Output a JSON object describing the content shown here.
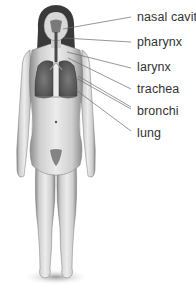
{
  "diagram": {
    "figure": "female human body, front view",
    "colors": {
      "background": "#ffffff",
      "label_text": "#333333",
      "leader_line": "#6a6a6a",
      "skin_light": "#e6e6e6",
      "skin_mid": "#b8b8b8",
      "skin_dark": "#6e6e6e",
      "hair": "#3a3a3a",
      "lungs": "#5c5c5c",
      "airway": "#4a4a4a"
    },
    "labels": [
      {
        "id": "nasal-cavity",
        "text": "nasal cavity",
        "x": 137,
        "y": 10
      },
      {
        "id": "pharynx",
        "text": "pharynx",
        "x": 137,
        "y": 35
      },
      {
        "id": "larynx",
        "text": "larynx",
        "x": 137,
        "y": 60
      },
      {
        "id": "trachea",
        "text": "trachea",
        "x": 137,
        "y": 82
      },
      {
        "id": "bronchi",
        "text": "bronchi",
        "x": 137,
        "y": 104
      },
      {
        "id": "lung",
        "text": "lung",
        "x": 137,
        "y": 126
      }
    ]
  }
}
